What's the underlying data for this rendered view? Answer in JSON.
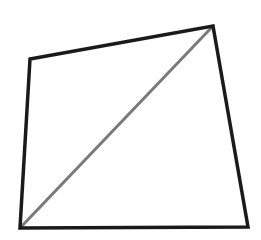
{
  "diagram": {
    "type": "quadrilateral-with-diagonal",
    "background": "#ffffff",
    "quadrilateral": {
      "vertices": [
        {
          "name": "top-left",
          "x": 30,
          "y": 59
        },
        {
          "name": "top-right",
          "x": 213,
          "y": 26
        },
        {
          "name": "bottom-right",
          "x": 248,
          "y": 227
        },
        {
          "name": "bottom-left",
          "x": 20,
          "y": 228
        }
      ],
      "stroke": "#1a1a1a",
      "stroke_width": 3.5
    },
    "diagonal": {
      "from": {
        "x": 20,
        "y": 228
      },
      "to": {
        "x": 213,
        "y": 26
      },
      "stroke": "#7a7a7a",
      "stroke_width": 3
    }
  }
}
